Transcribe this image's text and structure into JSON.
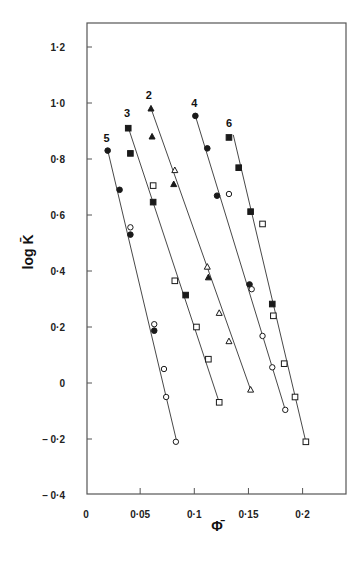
{
  "chart_data": {
    "type": "scatter",
    "title": "",
    "xlabel": "Φ̄",
    "ylabel": "log K̄",
    "xlim": [
      0,
      0.24
    ],
    "ylim": [
      -0.4,
      1.3
    ],
    "grid": false,
    "legend": "none (series numbered directly on plot)",
    "x_ticks": [
      {
        "v": 0,
        "label": "0"
      },
      {
        "v": 0.05,
        "label": "0·05"
      },
      {
        "v": 0.1,
        "label": "0·1"
      },
      {
        "v": 0.15,
        "label": "0·15"
      },
      {
        "v": 0.2,
        "label": "0·2"
      }
    ],
    "y_ticks": [
      {
        "v": 1.2,
        "label": "1·2"
      },
      {
        "v": 1.0,
        "label": "1·0"
      },
      {
        "v": 0.8,
        "label": "0·8"
      },
      {
        "v": 0.6,
        "label": "0·6"
      },
      {
        "v": 0.4,
        "label": "0·4"
      },
      {
        "v": 0.2,
        "label": "0·2"
      },
      {
        "v": 0,
        "label": "0"
      },
      {
        "v": -0.2,
        "label": "– 0·2"
      },
      {
        "v": -0.4,
        "label": "– 0·4"
      }
    ],
    "series": [
      {
        "name": "5",
        "label_pos": [
          0.019,
          0.86
        ],
        "line": [
          [
            0.02,
            0.832
          ],
          [
            0.084,
            -0.213
          ]
        ],
        "points": [
          {
            "x": 0.02,
            "y": 0.83,
            "marker": "filled-circle"
          },
          {
            "x": 0.031,
            "y": 0.69,
            "marker": "filled-circle"
          },
          {
            "x": 0.041,
            "y": 0.556,
            "marker": "open-circle"
          },
          {
            "x": 0.041,
            "y": 0.53,
            "marker": "filled-circle"
          },
          {
            "x": 0.063,
            "y": 0.21,
            "marker": "open-circle"
          },
          {
            "x": 0.063,
            "y": 0.187,
            "marker": "filled-circle"
          },
          {
            "x": 0.072,
            "y": 0.05,
            "marker": "open-circle"
          },
          {
            "x": 0.074,
            "y": -0.05,
            "marker": "open-circle"
          },
          {
            "x": 0.083,
            "y": -0.21,
            "marker": "open-circle"
          }
        ]
      },
      {
        "name": "3",
        "label_pos": [
          0.038,
          0.95
        ],
        "line": [
          [
            0.039,
            0.913
          ],
          [
            0.123,
            -0.069
          ]
        ],
        "points": [
          {
            "x": 0.039,
            "y": 0.91,
            "marker": "filled-square"
          },
          {
            "x": 0.041,
            "y": 0.82,
            "marker": "filled-square"
          },
          {
            "x": 0.062,
            "y": 0.705,
            "marker": "open-square"
          },
          {
            "x": 0.062,
            "y": 0.646,
            "marker": "filled-square"
          },
          {
            "x": 0.082,
            "y": 0.365,
            "marker": "open-square"
          },
          {
            "x": 0.092,
            "y": 0.314,
            "marker": "filled-square"
          },
          {
            "x": 0.102,
            "y": 0.2,
            "marker": "open-square"
          },
          {
            "x": 0.113,
            "y": 0.085,
            "marker": "open-square"
          },
          {
            "x": 0.123,
            "y": -0.069,
            "marker": "open-square"
          }
        ]
      },
      {
        "name": "2",
        "label_pos": [
          0.058,
          1.015
        ],
        "line": [
          [
            0.06,
            0.981
          ],
          [
            0.152,
            -0.024
          ]
        ],
        "points": [
          {
            "x": 0.06,
            "y": 0.98,
            "marker": "filled-triangle"
          },
          {
            "x": 0.061,
            "y": 0.88,
            "marker": "filled-triangle"
          },
          {
            "x": 0.082,
            "y": 0.76,
            "marker": "open-triangle"
          },
          {
            "x": 0.081,
            "y": 0.71,
            "marker": "filled-triangle"
          },
          {
            "x": 0.112,
            "y": 0.415,
            "marker": "open-triangle"
          },
          {
            "x": 0.113,
            "y": 0.377,
            "marker": "filled-triangle"
          },
          {
            "x": 0.123,
            "y": 0.25,
            "marker": "open-triangle"
          },
          {
            "x": 0.132,
            "y": 0.149,
            "marker": "open-triangle"
          },
          {
            "x": 0.152,
            "y": -0.024,
            "marker": "open-triangle"
          }
        ]
      },
      {
        "name": "4",
        "label_pos": [
          0.1,
          0.985
        ],
        "line": [
          [
            0.101,
            0.954
          ],
          [
            0.184,
            -0.096
          ]
        ],
        "points": [
          {
            "x": 0.101,
            "y": 0.954,
            "marker": "filled-circle"
          },
          {
            "x": 0.112,
            "y": 0.838,
            "marker": "filled-circle"
          },
          {
            "x": 0.121,
            "y": 0.669,
            "marker": "filled-circle"
          },
          {
            "x": 0.132,
            "y": 0.675,
            "marker": "open-circle"
          },
          {
            "x": 0.151,
            "y": 0.352,
            "marker": "filled-circle"
          },
          {
            "x": 0.153,
            "y": 0.335,
            "marker": "open-circle"
          },
          {
            "x": 0.163,
            "y": 0.168,
            "marker": "open-circle"
          },
          {
            "x": 0.172,
            "y": 0.056,
            "marker": "open-circle"
          },
          {
            "x": 0.184,
            "y": -0.096,
            "marker": "open-circle"
          }
        ]
      },
      {
        "name": "6",
        "label_pos": [
          0.132,
          0.915
        ],
        "line": [
          [
            0.136,
            0.886
          ],
          [
            0.203,
            -0.21
          ]
        ],
        "points": [
          {
            "x": 0.132,
            "y": 0.877,
            "marker": "filled-square"
          },
          {
            "x": 0.141,
            "y": 0.769,
            "marker": "filled-square"
          },
          {
            "x": 0.152,
            "y": 0.612,
            "marker": "filled-square"
          },
          {
            "x": 0.163,
            "y": 0.568,
            "marker": "open-square"
          },
          {
            "x": 0.172,
            "y": 0.282,
            "marker": "filled-square"
          },
          {
            "x": 0.173,
            "y": 0.24,
            "marker": "open-square"
          },
          {
            "x": 0.183,
            "y": 0.069,
            "marker": "open-square"
          },
          {
            "x": 0.193,
            "y": -0.05,
            "marker": "open-square"
          },
          {
            "x": 0.203,
            "y": -0.21,
            "marker": "open-square"
          }
        ]
      }
    ]
  },
  "layout": {
    "frame": {
      "left": 87,
      "top": 23,
      "right": 346,
      "bottom": 494
    },
    "x_map": {
      "origin_px": 86,
      "px_per_unit": 1083
    },
    "y_map": {
      "origin_px": 383,
      "px_per_unit": 280
    },
    "ink_color": "#1a1a1a",
    "frame_color": "#555555"
  }
}
